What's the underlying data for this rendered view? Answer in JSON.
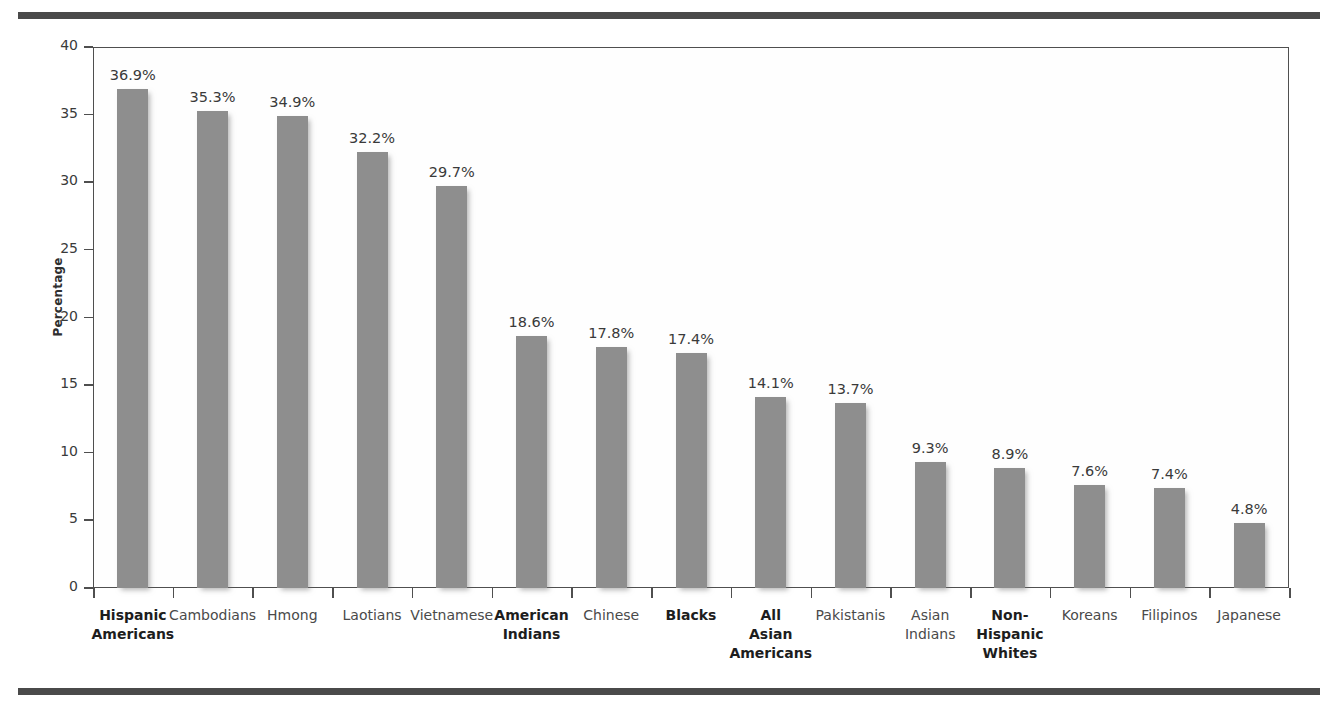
{
  "figure": {
    "top_rule": "horizontal-rule",
    "bottom_rule": "horizontal-rule"
  },
  "chart_data": {
    "type": "bar",
    "title": "",
    "xlabel": "",
    "ylabel": "Percentage",
    "ylim": [
      0,
      40
    ],
    "yticks": [
      0,
      5,
      10,
      15,
      20,
      25,
      30,
      35,
      40
    ],
    "ytick_labels": [
      "0",
      "5",
      "10",
      "15",
      "20",
      "25",
      "30",
      "35",
      "40"
    ],
    "grid": false,
    "legend": null,
    "bar_color": "#8e8e8e",
    "value_label_suffix": "%",
    "categories": [
      "Hispanic\nAmericans",
      "Cambodians",
      "Hmong",
      "Laotians",
      "Vietnamese",
      "American\nIndians",
      "Chinese",
      "Blacks",
      "All\nAsian\nAmericans",
      "Pakistanis",
      "Asian\nIndians",
      "Non-\nHispanic\nWhites",
      "Koreans",
      "Filipinos",
      "Japanese"
    ],
    "category_emphasis": [
      true,
      false,
      false,
      false,
      false,
      true,
      false,
      true,
      true,
      false,
      false,
      true,
      false,
      false,
      false
    ],
    "values": [
      36.9,
      35.3,
      34.9,
      32.2,
      29.7,
      18.6,
      17.8,
      17.4,
      14.1,
      13.7,
      9.3,
      8.9,
      7.6,
      7.4,
      4.8
    ],
    "value_labels": [
      "36.9%",
      "35.3%",
      "34.9%",
      "32.2%",
      "29.7%",
      "18.6%",
      "17.8%",
      "17.4%",
      "14.1%",
      "13.7%",
      "9.3%",
      "8.9%",
      "7.6%",
      "7.4%",
      "4.8%"
    ]
  }
}
